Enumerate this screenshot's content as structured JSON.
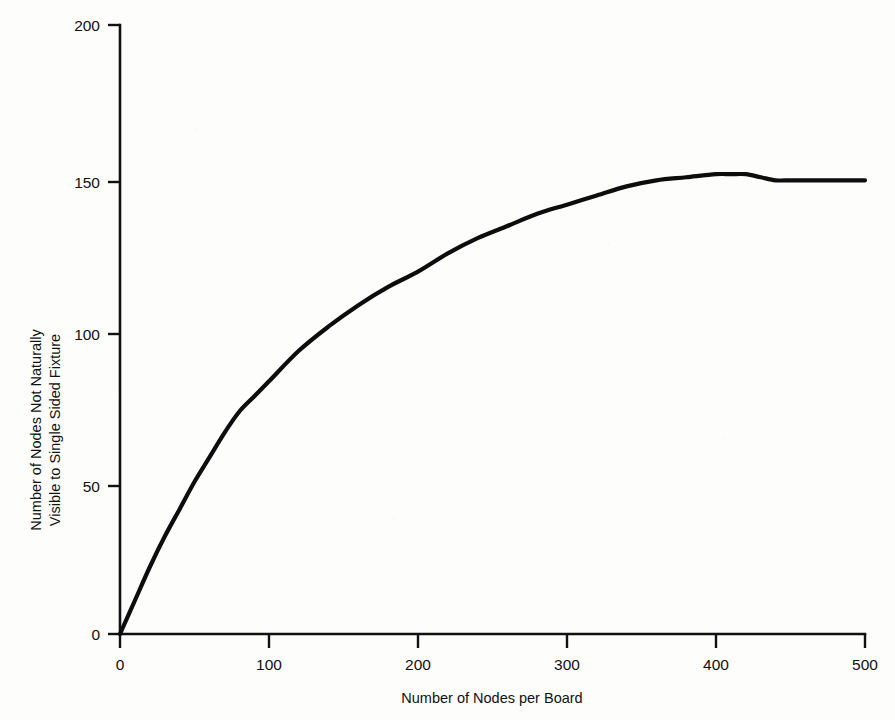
{
  "chart_data": {
    "type": "line",
    "title": "",
    "xlabel": "Number of Nodes per Board",
    "ylabel_line1": "Number of Nodes Not Naturally",
    "ylabel_line2": "Visible to Single Sided Fixture",
    "ylabel": "Number of Nodes Not Naturally Visible to Single Sided Fixture",
    "xlim": [
      0,
      500
    ],
    "ylim": [
      0,
      200
    ],
    "xticks": [
      0,
      100,
      200,
      300,
      400,
      500
    ],
    "xtick_labels": [
      "0",
      "100",
      "200",
      "300",
      "400",
      "500"
    ],
    "yticks": [
      0,
      50,
      100,
      150,
      200
    ],
    "ytick_labels": [
      "0",
      "50",
      "100",
      "150",
      "200"
    ],
    "grid": false,
    "legend": null,
    "series": [
      {
        "name": "Nodes not naturally visible",
        "x": [
          0,
          10,
          20,
          30,
          40,
          50,
          60,
          70,
          80,
          90,
          100,
          120,
          140,
          160,
          180,
          200,
          220,
          240,
          260,
          280,
          300,
          320,
          340,
          360,
          380,
          400,
          410,
          420,
          430,
          440,
          450,
          460,
          470,
          480,
          490,
          500
        ],
        "values": [
          0,
          11,
          22,
          32,
          41,
          50,
          58,
          66,
          73,
          78,
          83,
          93,
          101,
          108,
          114,
          119,
          125,
          130,
          134,
          138,
          141,
          144,
          147,
          149,
          150,
          151,
          151,
          151,
          150,
          149,
          149,
          149,
          149,
          149,
          149,
          149
        ]
      }
    ]
  },
  "figure": {
    "axis_color": "#111111",
    "curve_color": "#0d0d0d",
    "background_color": "#fdfdfc"
  }
}
